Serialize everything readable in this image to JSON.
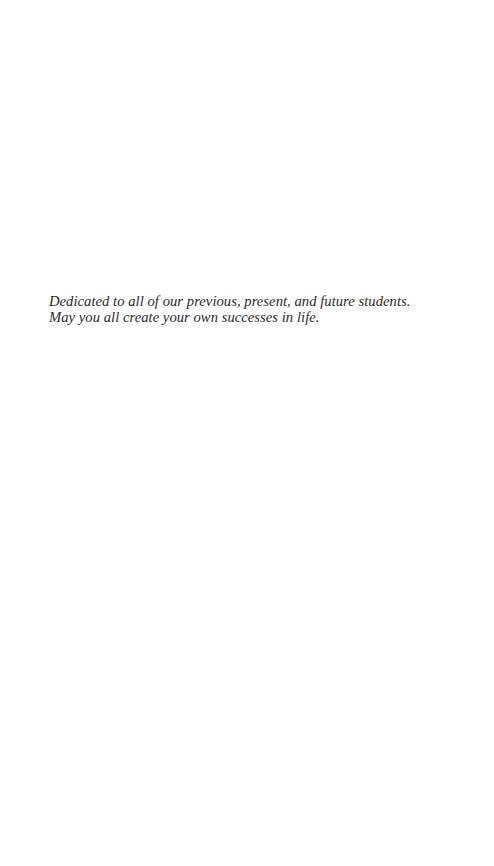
{
  "dedication": {
    "lines": [
      "Dedicated to all of our previous, present, and future students.",
      "May you all create your own successes in life."
    ]
  }
}
